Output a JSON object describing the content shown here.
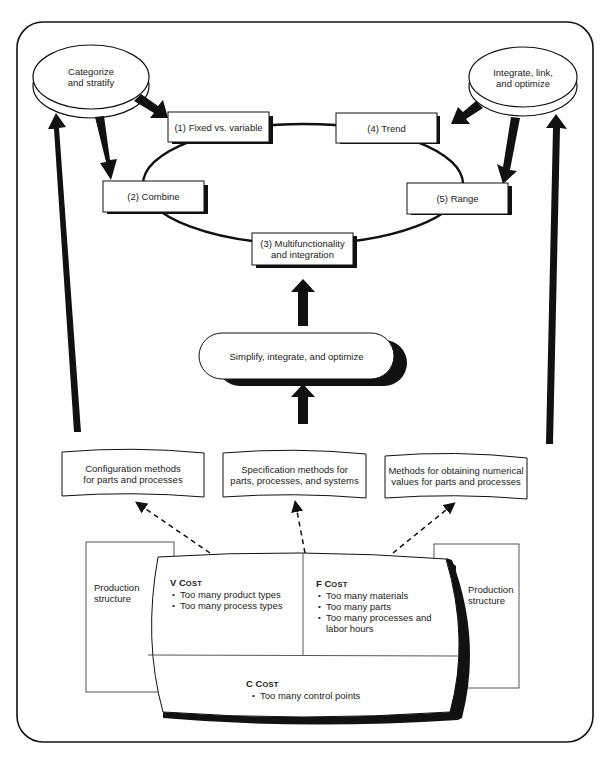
{
  "diagram": {
    "ellipses": {
      "categorize": {
        "line1": "Categorize",
        "line2": "and stratify"
      },
      "integrate": {
        "line1": "Integrate, link,",
        "line2": "and optimize"
      }
    },
    "cycle_boxes": {
      "fixed_variable": "(1) Fixed vs. variable",
      "combine": "(2) Combine",
      "multifunctionality": {
        "line1": "(3) Multifunctionality",
        "line2": "and integration"
      },
      "trend": "(4) Trend",
      "range": "(5) Range"
    },
    "simplify_pill": "Simplify, integrate, and optimize",
    "method_boxes": {
      "configuration": {
        "line1": "Configuration methods",
        "line2": "for parts and processes"
      },
      "specification": {
        "line1": "Specification methods for",
        "line2": "parts, processes, and systems"
      },
      "numerical": {
        "line1": "Methods for obtaining numerical",
        "line2": "values for parts and processes"
      }
    },
    "production_structure_left": {
      "line1": "Production",
      "line2": "structure"
    },
    "production_structure_right": {
      "line1": "Production",
      "line2": "structure"
    },
    "cost_panels": {
      "v_cost": {
        "letter": "V",
        "word_initial": "C",
        "word_rest": "OST",
        "items": [
          "Too many product types",
          "Too many process types"
        ]
      },
      "f_cost": {
        "letter": "F",
        "word_initial": "C",
        "word_rest": "OST",
        "items": [
          "Too many materials",
          "Too many parts",
          "Too many processes and labor hours"
        ]
      },
      "c_cost": {
        "letter": "C",
        "word_initial": "C",
        "word_rest": "OST",
        "items": [
          "Too many control points"
        ]
      }
    },
    "colors": {
      "ink": "#111111",
      "paper": "#ffffff",
      "text": "#222222"
    }
  }
}
